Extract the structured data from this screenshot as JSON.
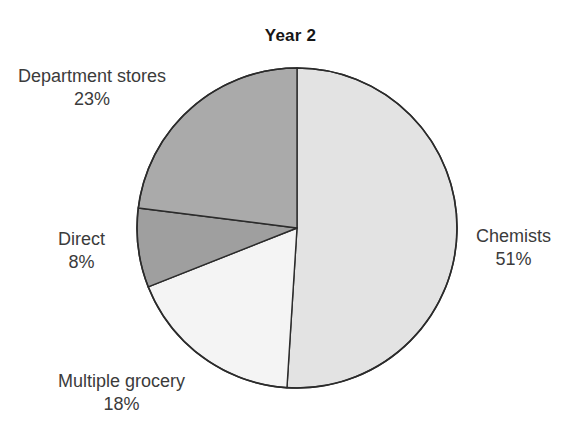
{
  "chart_data": {
    "type": "pie",
    "title": "Year 2",
    "xlabel": "",
    "ylabel": "",
    "legend_position": "none",
    "grid": false,
    "start_angle_deg": 0,
    "direction": "clockwise",
    "categories": [
      "Chemists",
      "Multiple grocery",
      "Direct",
      "Department stores"
    ],
    "values": [
      51,
      18,
      8,
      23
    ],
    "unit": "%",
    "slices": [
      {
        "label": "Chemists",
        "value": 51,
        "value_text": "51%",
        "color": "#e3e3e3",
        "start_deg": 0,
        "end_deg": 183.6
      },
      {
        "label": "Multiple grocery",
        "value": 18,
        "value_text": "18%",
        "color": "#f4f4f4",
        "start_deg": 183.6,
        "end_deg": 248.4
      },
      {
        "label": "Direct",
        "value": 8,
        "value_text": "8%",
        "color": "#9f9f9f",
        "start_deg": 248.4,
        "end_deg": 277.2
      },
      {
        "label": "Department stores",
        "value": 23,
        "value_text": "23%",
        "color": "#aaaaaa",
        "start_deg": 277.2,
        "end_deg": 360
      }
    ]
  },
  "title": "Year 2",
  "labels": {
    "department_stores": {
      "name": "Department stores",
      "value": "23%"
    },
    "direct": {
      "name": "Direct",
      "value": "8%"
    },
    "multiple_grocery": {
      "name": "Multiple grocery",
      "value": "18%"
    },
    "chemists": {
      "name": "Chemists",
      "value": "51%"
    }
  },
  "geometry": {
    "center_x": 297,
    "center_y": 228,
    "radius": 160,
    "outline_color": "#2b2b2b"
  }
}
